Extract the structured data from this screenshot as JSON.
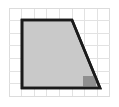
{
  "figure": {
    "title": "Right trapezoid drawn on a square grid",
    "canvas": {
      "width": 119,
      "height": 107,
      "background": "#ffffff"
    },
    "grid": {
      "name": "square-grid",
      "origin_x": 9,
      "origin_y": 8,
      "cell_size": 12.6,
      "columns": 8,
      "rows": 7,
      "line_color": "#e2e2e2",
      "line_width": 1,
      "outer_line_color": "#dcdcdc",
      "visible": true
    },
    "shape": {
      "name": "trapezoid",
      "type": "polygon",
      "sides": 4,
      "points": [
        {
          "label": "top-left",
          "x": 22,
          "y": 20
        },
        {
          "label": "top-right",
          "x": 72,
          "y": 20
        },
        {
          "label": "bottom-right",
          "x": 100,
          "y": 88
        },
        {
          "label": "bottom-left",
          "x": 22,
          "y": 88
        }
      ],
      "points_attr": "22,20 72,20 100,88 22,88",
      "fill_color": "#c9c9c9",
      "fill_opacity": 1,
      "stroke_color": "#1a1a1a",
      "stroke_width": 2.6,
      "width_cells_top": 4,
      "width_cells_bottom": 6,
      "height_cells": 5.4
    },
    "highlight_cell": {
      "name": "shaded-grid-cell",
      "description": "darker shaded partial grid square inside lower right of trapezoid",
      "x": 83,
      "y": 76,
      "width": 12.6,
      "height": 12.6,
      "fill_color": "#8f8f8f",
      "clipped_to_shape": true
    }
  }
}
